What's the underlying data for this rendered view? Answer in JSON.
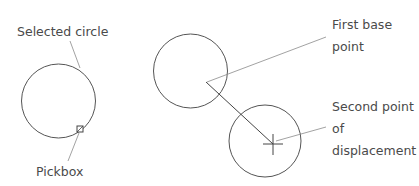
{
  "diagram": {
    "labels": {
      "selected_circle": "Selected circle",
      "pickbox": "Pickbox",
      "first_base_point_line1": "First base",
      "first_base_point_line2": "point",
      "second_point_line1": "Second point",
      "second_point_line2": "of",
      "second_point_line3": "displacement"
    },
    "colors": {
      "stroke": "#555555",
      "leader": "#8a8a8a",
      "text": "#4a4a4a"
    }
  }
}
